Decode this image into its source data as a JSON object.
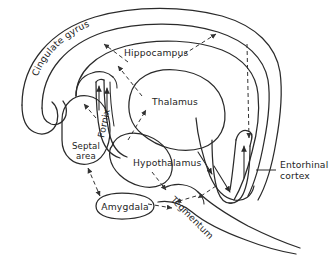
{
  "figure": {
    "background_color": "#ffffff",
    "ink_color": "#2a2a2a",
    "text_color": "#242424"
  },
  "labels": {
    "cingulate_gyrus": "Cingulate gyrus",
    "hippocampus": "Hippocampus",
    "thalamus": "Thalamus",
    "fornix": "Fornix",
    "septal_area_line1": "Septal",
    "septal_area_line2": "area",
    "hypothalamus": "Hypothalamus",
    "amygdala": "Amygdala",
    "tegmentum": "Tegmentum",
    "entorhinal_cortex_line1": "Entorhinal",
    "entorhinal_cortex_line2": "cortex"
  },
  "structures": [
    {
      "name": "cingulate-gyrus",
      "label": "Cingulate gyrus",
      "label_orientation": "curved-arc"
    },
    {
      "name": "hippocampus",
      "label": "Hippocampus",
      "label_orientation": "horizontal"
    },
    {
      "name": "thalamus",
      "label": "Thalamus",
      "label_orientation": "horizontal"
    },
    {
      "name": "fornix",
      "label": "Fornix",
      "label_orientation": "vertical-rotated"
    },
    {
      "name": "septal-area",
      "label": "Septal area",
      "label_orientation": "horizontal-two-line"
    },
    {
      "name": "hypothalamus",
      "label": "Hypothalamus",
      "label_orientation": "horizontal"
    },
    {
      "name": "amygdala",
      "label": "Amygdala",
      "label_orientation": "horizontal"
    },
    {
      "name": "tegmentum",
      "label": "Tegmentum",
      "label_orientation": "diagonal-rotated"
    },
    {
      "name": "entorhinal-cortex",
      "label": "Entorhinal cortex",
      "label_orientation": "horizontal-two-line"
    }
  ],
  "connections": [
    {
      "from": "hippocampus",
      "to": "cingulate-gyrus",
      "style": "dashed"
    },
    {
      "from": "cingulate-gyrus",
      "to": "entorhinal-cortex",
      "style": "dashed"
    },
    {
      "from": "thalamus",
      "to": "cingulate-gyrus",
      "style": "dashed"
    },
    {
      "from": "fornix",
      "to": "hippocampus",
      "style": "solid"
    },
    {
      "from": "hypothalamus",
      "to": "thalamus",
      "style": "dashed"
    },
    {
      "from": "septal-area",
      "to": "amygdala",
      "style": "dashed-bidirectional"
    },
    {
      "from": "hypothalamus",
      "to": "tegmentum",
      "style": "dashed"
    },
    {
      "from": "amygdala",
      "to": "tegmentum",
      "style": "dashed"
    },
    {
      "from": "entorhinal-cortex",
      "to": "tegmentum",
      "style": "dashed"
    }
  ]
}
